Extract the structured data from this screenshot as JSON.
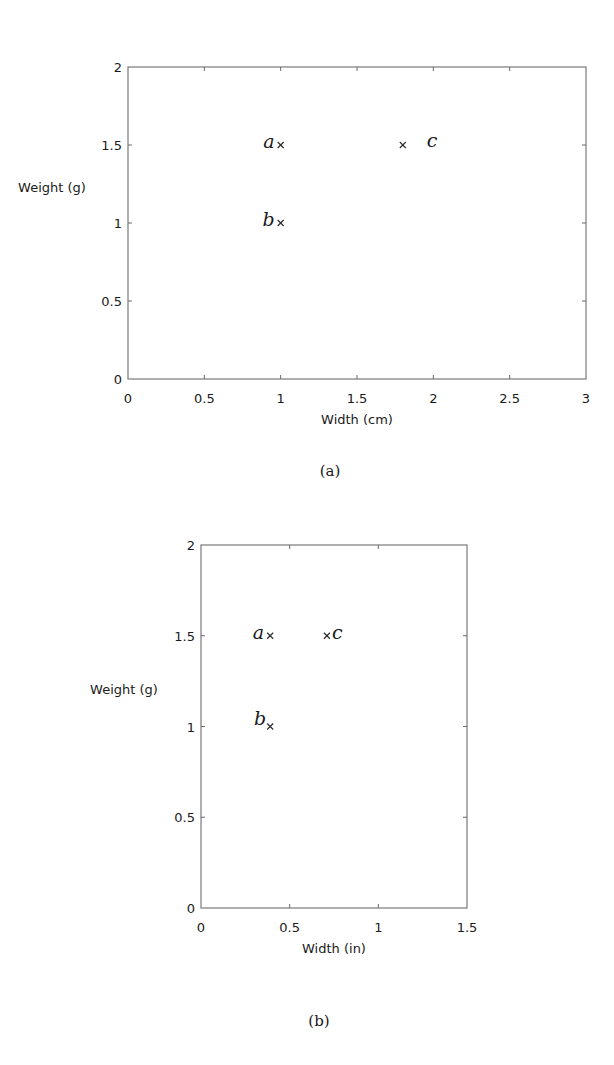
{
  "chart_data": [
    {
      "id": "a",
      "type": "scatter",
      "title": "",
      "caption": "(a)",
      "xlabel": "Width (cm)",
      "ylabel": "Weight (g)",
      "xlim": [
        0,
        3
      ],
      "ylim": [
        0,
        2
      ],
      "xticks": [
        0,
        0.5,
        1,
        1.5,
        2,
        2.5,
        3
      ],
      "xtick_labels": [
        "0",
        "0.5",
        "1",
        "1.5",
        "2",
        "2.5",
        "3"
      ],
      "yticks": [
        0,
        0.5,
        1,
        1.5,
        2
      ],
      "ytick_labels": [
        "0",
        "0.5",
        "1",
        "1.5",
        "2"
      ],
      "grid": false,
      "marker": "x",
      "points": [
        {
          "label": "a",
          "x": 1.0,
          "y": 1.5,
          "label_side": "left"
        },
        {
          "label": "b",
          "x": 1.0,
          "y": 1.0,
          "label_side": "left"
        },
        {
          "label": "c",
          "x": 1.8,
          "y": 1.5,
          "label_side": "right"
        }
      ],
      "layout": {
        "left": 128,
        "top": 67,
        "right": 586,
        "bottom": 379,
        "caption_y": 476,
        "ylabel_x": 52,
        "ylabel_y": 192
      }
    },
    {
      "id": "b",
      "type": "scatter",
      "title": "",
      "caption": "(b)",
      "xlabel": "Width (in)",
      "ylabel": "Weight (g)",
      "xlim": [
        0,
        1.5
      ],
      "ylim": [
        0,
        2
      ],
      "xticks": [
        0,
        0.5,
        1,
        1.5
      ],
      "xtick_labels": [
        "0",
        "0.5",
        "1",
        "1.5"
      ],
      "yticks": [
        0,
        0.5,
        1,
        1.5,
        2
      ],
      "ytick_labels": [
        "0",
        "0.5",
        "1",
        "1.5",
        "2"
      ],
      "grid": false,
      "marker": "x",
      "points": [
        {
          "label": "a",
          "x": 0.39,
          "y": 1.5,
          "label_side": "left"
        },
        {
          "label": "b",
          "x": 0.39,
          "y": 1.0,
          "label_side": "left-high"
        },
        {
          "label": "c",
          "x": 0.71,
          "y": 1.5,
          "label_side": "right-close"
        }
      ],
      "layout": {
        "left": 201,
        "top": 545,
        "right": 467,
        "bottom": 908,
        "caption_y": 1026,
        "ylabel_x": 124,
        "ylabel_y": 694
      }
    }
  ]
}
